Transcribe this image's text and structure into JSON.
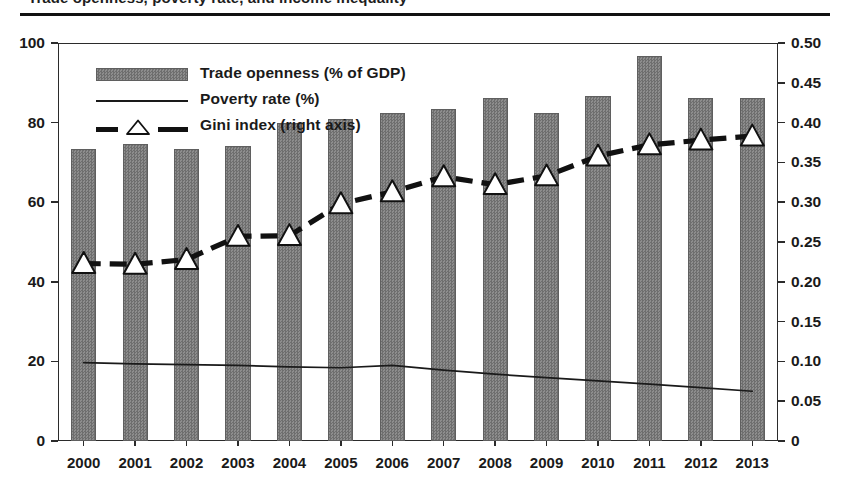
{
  "caption": {
    "clipped_text": "Trade openness, poverty rate, and income inequality"
  },
  "legend": {
    "position": "inside-top-left",
    "items": [
      {
        "key": "bar",
        "label": "Trade openness (% of GDP)",
        "marker": "filled-rect-swatch"
      },
      {
        "key": "line",
        "label": "Poverty rate (%)",
        "marker": "thin-solid-line"
      },
      {
        "key": "gini",
        "label": "Gini index (right axis)",
        "marker": "dashed-line-triangle"
      }
    ]
  },
  "axes": {
    "left": {
      "ticks": [
        "0",
        "20",
        "40",
        "60",
        "80",
        "100"
      ],
      "values": [
        0,
        20,
        40,
        60,
        80,
        100
      ],
      "min": 0,
      "max": 100
    },
    "right": {
      "ticks": [
        "0",
        "0.05",
        "0.10",
        "0.15",
        "0.20",
        "0.25",
        "0.30",
        "0.35",
        "0.40",
        "0.45",
        "0.50"
      ],
      "values": [
        0,
        0.05,
        0.1,
        0.15,
        0.2,
        0.25,
        0.3,
        0.35,
        0.4,
        0.45,
        0.5
      ],
      "min": 0,
      "max": 0.5
    },
    "x": {
      "ticks": [
        "2000",
        "2001",
        "2002",
        "2003",
        "2004",
        "2005",
        "2006",
        "2007",
        "2008",
        "2009",
        "2010",
        "2011",
        "2012",
        "2013"
      ]
    }
  },
  "colors": {
    "bar_fill": "#7a7a7a",
    "bar_edge": "#5f5f5f",
    "line": "#1a1a1a",
    "gini_line": "#111111",
    "marker_fill": "#ffffff",
    "frame": "#2b2b2b",
    "background": "#ffffff"
  },
  "chart_data": {
    "type": "bar",
    "title": "",
    "subtitle": "",
    "xlabel": "",
    "ylabel": "",
    "y2label": "",
    "grid": false,
    "legend_position": "inside-top-left",
    "categories": [
      "2000",
      "2001",
      "2002",
      "2003",
      "2004",
      "2005",
      "2006",
      "2007",
      "2008",
      "2009",
      "2010",
      "2011",
      "2012",
      "2013"
    ],
    "ylim": [
      0,
      100
    ],
    "y2lim": [
      0,
      0.5
    ],
    "series": [
      {
        "name": "Trade openness (% of GDP)",
        "type": "bar",
        "axis": "left",
        "unit": "% of GDP",
        "values": [
          73.4,
          74.7,
          73.4,
          74.1,
          79.8,
          80.8,
          82.5,
          83.4,
          86.1,
          82.5,
          86.8,
          96.7,
          86.1,
          86.1
        ]
      },
      {
        "name": "Poverty rate (%)",
        "type": "line",
        "axis": "left",
        "unit": "%",
        "values": [
          19.7,
          19.4,
          19.2,
          19.0,
          18.6,
          18.4,
          19.0,
          17.8,
          16.8,
          15.9,
          15.1,
          14.3,
          13.4,
          12.5
        ]
      },
      {
        "name": "Gini index (right axis)",
        "type": "line-marker",
        "axis": "right",
        "unit": "index",
        "values": [
          0.223,
          0.222,
          0.228,
          0.257,
          0.258,
          0.298,
          0.313,
          0.332,
          0.322,
          0.333,
          0.358,
          0.372,
          0.378,
          0.383
        ]
      }
    ]
  }
}
